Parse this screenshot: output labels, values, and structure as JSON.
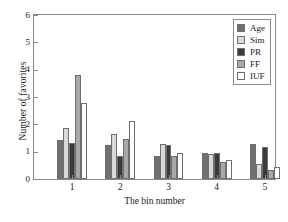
{
  "chart_data": {
    "type": "bar",
    "title": "",
    "xlabel": "The bin number",
    "ylabel": "Number of favorites",
    "categories": [
      "1",
      "2",
      "3",
      "4",
      "5"
    ],
    "ylim": [
      0,
      6
    ],
    "yticks": [
      0,
      1,
      2,
      3,
      4,
      5,
      6
    ],
    "grid": false,
    "legend_position": "top-right",
    "series": [
      {
        "name": "Age",
        "color": "#707070",
        "values": [
          1.42,
          1.26,
          0.84,
          0.94,
          1.29
        ]
      },
      {
        "name": "Sim",
        "color": "#d9d9d9",
        "values": [
          1.85,
          1.64,
          1.28,
          0.9,
          0.55
        ]
      },
      {
        "name": "PR",
        "color": "#3a3a3a",
        "values": [
          1.32,
          0.85,
          1.23,
          0.94,
          1.17
        ]
      },
      {
        "name": "FF",
        "color": "#a8a8a8",
        "values": [
          3.82,
          1.48,
          0.83,
          0.61,
          0.32
        ]
      },
      {
        "name": "IUF",
        "color": "#ffffff",
        "values": [
          2.78,
          2.14,
          0.94,
          0.68,
          0.45
        ]
      }
    ]
  },
  "legend": {
    "items": [
      {
        "label": "Age"
      },
      {
        "label": "Sim"
      },
      {
        "label": "PR"
      },
      {
        "label": "FF"
      },
      {
        "label": "IUF"
      }
    ]
  },
  "axis": {
    "y_tick_labels": [
      "0",
      "1",
      "2",
      "3",
      "4",
      "5",
      "6"
    ],
    "x_tick_labels": [
      "1",
      "2",
      "3",
      "4",
      "5"
    ]
  }
}
